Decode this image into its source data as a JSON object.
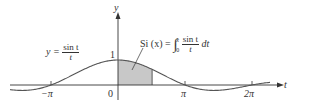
{
  "chart_data": {
    "type": "line",
    "title": "",
    "xlabel": "t",
    "ylabel": "y",
    "function": "sin(t)/t",
    "curve_label": {
      "lhs": "y =",
      "num": "sin t",
      "den": "t"
    },
    "integral_label": {
      "lhs": "Si (x) =",
      "lower": "0",
      "upper": "x",
      "num": "sin t",
      "den": "t",
      "tail": "dt"
    },
    "x_ticks": [
      {
        "value": -3.14159,
        "label": "−π"
      },
      {
        "value": 0,
        "label": "0"
      },
      {
        "value": 3.14159,
        "label": "π"
      },
      {
        "value": 6.28318,
        "label": "2π"
      }
    ],
    "y_ticks": [
      {
        "value": 1,
        "label": "1"
      }
    ],
    "xlim": [
      -5.0,
      8.0
    ],
    "ylim": [
      -0.3,
      1.3
    ],
    "shaded_region": {
      "from": 0,
      "to": 1.6,
      "color": "#c8c8c8",
      "meaning": "area = Si(x)"
    },
    "grid": false,
    "legend": null
  },
  "colors": {
    "curve": "#555555",
    "axis": "#333333",
    "shade": "#c8c8c8"
  },
  "labels": {
    "y_axis": "y",
    "t_axis": "t",
    "origin": "0",
    "one": "1",
    "neg_pi": "−π",
    "pi": "π",
    "two_pi": "2π",
    "curve_lhs": "y =",
    "curve_num": "sin t",
    "curve_den": "t",
    "si_lhs": "Si (x) =",
    "si_lower": "0",
    "si_upper": "x",
    "si_num": "sin t",
    "si_den": "t",
    "si_tail": "dt"
  }
}
